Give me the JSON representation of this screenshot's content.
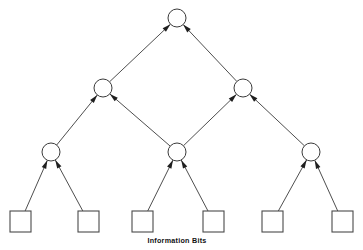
{
  "figure": {
    "kind": "tree-diagram",
    "caption": "Information Bits",
    "background_color": "#ffffff",
    "line_color": "#3a3a3a",
    "node_fill": "#ffffff",
    "arrow_color": "#1f1f1f"
  },
  "nodes": {
    "circles": [
      {
        "id": "root",
        "label": "",
        "cx": 177,
        "cy": 18,
        "r": 9,
        "level": 0,
        "name": "check-node-root"
      },
      {
        "id": "mid-left",
        "label": "",
        "cx": 103,
        "cy": 88,
        "r": 9,
        "level": 1,
        "name": "check-node-mid-left"
      },
      {
        "id": "mid-right",
        "label": "",
        "cx": 243,
        "cy": 88,
        "r": 9,
        "level": 1,
        "name": "check-node-mid-right"
      },
      {
        "id": "low-left",
        "label": "",
        "cx": 51,
        "cy": 152,
        "r": 9,
        "level": 2,
        "name": "check-node-low-left"
      },
      {
        "id": "low-mid",
        "label": "",
        "cx": 177,
        "cy": 152,
        "r": 9,
        "level": 2,
        "name": "check-node-low-mid"
      },
      {
        "id": "low-right",
        "label": "",
        "cx": 311,
        "cy": 152,
        "r": 9,
        "level": 2,
        "name": "check-node-low-right"
      }
    ],
    "squares": [
      {
        "id": "bit1",
        "label": "",
        "x": 10,
        "y": 211,
        "w": 21,
        "h": 21,
        "name": "information-bit-1"
      },
      {
        "id": "bit2",
        "label": "",
        "x": 78,
        "y": 211,
        "w": 21,
        "h": 21,
        "name": "information-bit-2"
      },
      {
        "id": "bit3",
        "label": "",
        "x": 132,
        "y": 211,
        "w": 21,
        "h": 21,
        "name": "information-bit-3"
      },
      {
        "id": "bit4",
        "label": "",
        "x": 203,
        "y": 211,
        "w": 21,
        "h": 21,
        "name": "information-bit-4"
      },
      {
        "id": "bit5",
        "label": "",
        "x": 262,
        "y": 211,
        "w": 21,
        "h": 21,
        "name": "information-bit-5"
      },
      {
        "id": "bit6",
        "label": "",
        "x": 332,
        "y": 211,
        "w": 21,
        "h": 21,
        "name": "information-bit-6"
      }
    ]
  },
  "edges": [
    {
      "from": "mid-left",
      "to": "root",
      "arrow": true
    },
    {
      "from": "mid-right",
      "to": "root",
      "arrow": true
    },
    {
      "from": "low-left",
      "to": "mid-left",
      "arrow": true
    },
    {
      "from": "low-mid",
      "to": "mid-left",
      "arrow": true
    },
    {
      "from": "low-mid",
      "to": "mid-right",
      "arrow": true
    },
    {
      "from": "low-right",
      "to": "mid-right",
      "arrow": true
    },
    {
      "from": "bit1",
      "to": "low-left",
      "arrow": true
    },
    {
      "from": "bit2",
      "to": "low-left",
      "arrow": true
    },
    {
      "from": "bit3",
      "to": "low-mid",
      "arrow": true
    },
    {
      "from": "bit4",
      "to": "low-mid",
      "arrow": true
    },
    {
      "from": "bit5",
      "to": "low-right",
      "arrow": true
    },
    {
      "from": "bit6",
      "to": "low-right",
      "arrow": true
    }
  ],
  "caption": {
    "text": "Information Bits",
    "x": 177,
    "y": 243
  }
}
